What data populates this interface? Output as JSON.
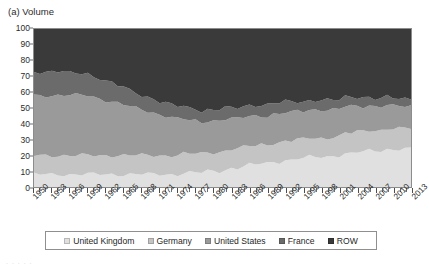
{
  "panel": {
    "title": "(a) Volume"
  },
  "artifact": {
    "text": ". . . . ."
  },
  "legend": {
    "position": "bottom",
    "items": [
      {
        "label": "United Kingdom",
        "color": "#e0e0e0"
      },
      {
        "label": "Germany",
        "color": "#c4c4c4"
      },
      {
        "label": "United States",
        "color": "#9a9a9a"
      },
      {
        "label": "France",
        "color": "#6b6b6b"
      },
      {
        "label": "ROW",
        "color": "#3a3a3a"
      }
    ]
  },
  "chart_data": {
    "type": "area",
    "stacked": true,
    "title": "(a) Volume",
    "xlabel": "",
    "ylabel": "",
    "ylim": [
      0,
      100
    ],
    "yticks": [
      0,
      10,
      20,
      30,
      40,
      50,
      60,
      70,
      80,
      90,
      100
    ],
    "grid": false,
    "x": [
      1950,
      1951,
      1952,
      1953,
      1954,
      1955,
      1956,
      1957,
      1958,
      1959,
      1960,
      1961,
      1962,
      1963,
      1964,
      1965,
      1966,
      1967,
      1968,
      1969,
      1970,
      1971,
      1972,
      1973,
      1974,
      1975,
      1976,
      1977,
      1978,
      1979,
      1980,
      1981,
      1982,
      1983,
      1984,
      1985,
      1986,
      1987,
      1988,
      1989,
      1990,
      1991,
      1992,
      1993,
      1994,
      1995,
      1996,
      1997,
      1998,
      1999,
      2000,
      2001,
      2002,
      2003,
      2004,
      2005,
      2006,
      2007,
      2008,
      2009,
      2010,
      2011,
      2012,
      2013
    ],
    "xtick_labels": [
      "1950",
      "1953",
      "1956",
      "1959",
      "1962",
      "1965",
      "1968",
      "1971",
      "1974",
      "1977",
      "1980",
      "1983",
      "1986",
      "1989",
      "1992",
      "1995",
      "1998",
      "2001",
      "2004",
      "2007",
      "2010",
      "2013"
    ],
    "xtick_step_years": 3,
    "series": [
      {
        "name": "United Kingdom",
        "color": "#e0e0e0",
        "values": [
          8,
          8,
          8,
          8,
          8,
          8,
          8,
          8,
          8,
          8,
          8,
          8,
          8,
          8,
          8,
          8,
          8,
          8,
          8,
          8,
          8,
          8,
          8,
          8,
          8,
          9,
          9,
          9,
          9,
          10,
          10,
          10,
          11,
          12,
          12,
          13,
          14,
          14,
          15,
          15,
          16,
          16,
          17,
          17,
          18,
          18,
          19,
          19,
          19,
          19,
          20,
          20,
          21,
          21,
          22,
          22,
          23,
          23,
          23,
          24,
          24,
          24,
          24,
          24
        ]
      },
      {
        "name": "Germany",
        "color": "#c4c4c4",
        "values": [
          12,
          12,
          12,
          12,
          12,
          12,
          12,
          12,
          12,
          12,
          12,
          12,
          12,
          12,
          12,
          12,
          12,
          12,
          12,
          12,
          12,
          12,
          12,
          12,
          12,
          12,
          12,
          12,
          12,
          12,
          12,
          12,
          12,
          12,
          12,
          12,
          12,
          12,
          12,
          12,
          12,
          12,
          12,
          12,
          12,
          12,
          12,
          12,
          12,
          12,
          12,
          12,
          13,
          13,
          13,
          13,
          13,
          13,
          13,
          13,
          13,
          13,
          13,
          13
        ]
      },
      {
        "name": "United States",
        "color": "#9a9a9a",
        "values": [
          38,
          38,
          38,
          38,
          38,
          38,
          38,
          38,
          38,
          38,
          37,
          36,
          35,
          34,
          33,
          32,
          31,
          30,
          29,
          28,
          27,
          26,
          25,
          24,
          23,
          22,
          21,
          21,
          20,
          20,
          20,
          20,
          20,
          19,
          19,
          19,
          19,
          19,
          18,
          18,
          18,
          18,
          18,
          18,
          18,
          18,
          18,
          18,
          18,
          18,
          17,
          17,
          17,
          17,
          16,
          16,
          16,
          15,
          15,
          15,
          14,
          14,
          14,
          14
        ]
      },
      {
        "name": "France",
        "color": "#6b6b6b",
        "values": [
          15,
          15,
          15,
          15,
          15,
          15,
          14,
          14,
          14,
          14,
          13,
          13,
          12,
          12,
          11,
          11,
          10,
          10,
          9,
          9,
          9,
          8,
          8,
          8,
          8,
          8,
          8,
          8,
          7,
          7,
          7,
          7,
          7,
          7,
          7,
          7,
          7,
          7,
          7,
          7,
          7,
          7,
          7,
          7,
          6,
          6,
          6,
          6,
          6,
          6,
          6,
          6,
          6,
          6,
          6,
          6,
          5,
          5,
          5,
          5,
          5,
          5,
          5,
          5
        ]
      },
      {
        "name": "ROW",
        "color": "#3a3a3a",
        "values": [
          27,
          27,
          27,
          27,
          27,
          27,
          28,
          28,
          28,
          28,
          30,
          31,
          33,
          34,
          36,
          37,
          39,
          40,
          42,
          43,
          44,
          46,
          47,
          48,
          49,
          49,
          50,
          50,
          52,
          51,
          51,
          51,
          50,
          50,
          50,
          49,
          48,
          48,
          48,
          48,
          47,
          47,
          46,
          46,
          46,
          46,
          45,
          45,
          45,
          45,
          45,
          45,
          43,
          43,
          43,
          43,
          43,
          44,
          44,
          43,
          44,
          44,
          44,
          44
        ]
      }
    ]
  }
}
